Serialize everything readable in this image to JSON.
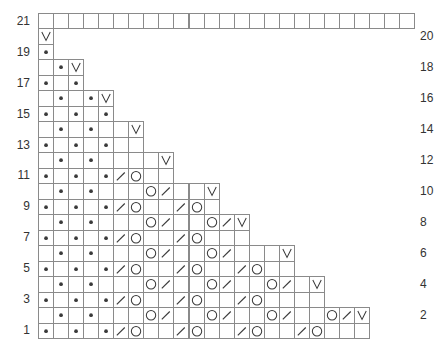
{
  "chart_title": "",
  "legend_symbols": {
    ".": "purl-dot-icon",
    "/": "k2tog-slash-icon",
    "O": "yarn-over-circle-icon",
    "V": "slip-v-icon",
    " ": "empty-knit-cell"
  },
  "colors": {
    "grid_line": "#8a8a8a",
    "symbol": "#3a3a3a",
    "label": "#333333",
    "background": "#ffffff"
  },
  "layout": {
    "origin_x": 38,
    "bottom_y": 338,
    "cell_w": 15.05,
    "cell_h": 15.48,
    "left_label_x": 8,
    "right_label_x": 420
  },
  "row_labels_left": [
    "21",
    "19",
    "17",
    "15",
    "13",
    "11",
    "9",
    "7",
    "5",
    "3",
    "1"
  ],
  "row_labels_right": [
    "20",
    "18",
    "16",
    "14",
    "12",
    "10",
    "8",
    "6",
    "4",
    "2"
  ],
  "rows": {
    "21": "                         ",
    "20": "V",
    "19": ".",
    "18": " .V",
    "17": ". .",
    "16": " . .V",
    "15": ". . .",
    "14": " . .  V",
    "13": ". . .  ",
    "12": " . .    V",
    "11": ". . ./O  ",
    "10": " . .   O/  V",
    "9": ". . ./O  /O ",
    "8": " . .   O/  O/V",
    "7": ". . ./O  /O   ",
    "6": " . .   O/  O/   V",
    "5": ". . ./O  /O  /O  ",
    "4": " . .   O/  O/  O/ V",
    "3": ". . ./O  /O  /O    ",
    "2": " . .   O/  O/  O/  O/V",
    "1": ". . ./O  /O  /O  /O   "
  }
}
